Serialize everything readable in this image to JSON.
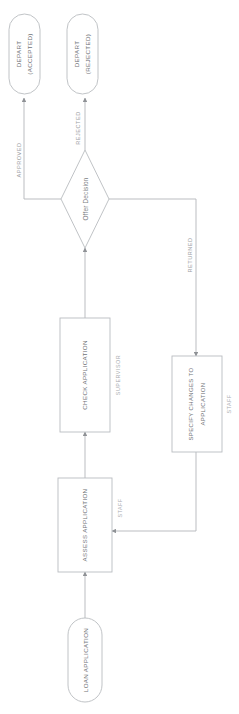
{
  "diagram": {
    "orientation": "rotated-90",
    "colors": {
      "stroke": "#b9bcc0",
      "edge": "#b3b6ba",
      "node_text": "#6f7276",
      "edge_text": "#9a9da1",
      "role_text": "#a9acb0",
      "background": "#ffffff"
    }
  },
  "nodes": {
    "start": {
      "label": "LOAN APPLICATION",
      "type": "terminator"
    },
    "assess": {
      "label": "ASSESS APPLICATION",
      "type": "process",
      "role": "STAFF"
    },
    "check": {
      "label": "CHECK APPLICATION",
      "type": "process",
      "role": "SUPERVISOR"
    },
    "decision": {
      "label": "Offer Decision",
      "type": "decision"
    },
    "specify": {
      "label_line1": "SPECIFY CHANGES TO",
      "label_line2": "APPLICATION",
      "type": "process",
      "role": "STAFF"
    },
    "end_accepted": {
      "label_line1": "DEPART",
      "label_line2": "(ACCEPTED)",
      "type": "terminator"
    },
    "end_rejected": {
      "label_line1": "DEPART",
      "label_line2": "(REJECTED)",
      "type": "terminator"
    }
  },
  "edges": {
    "approved": {
      "label": "APPROVED",
      "from": "decision",
      "to": "end_accepted"
    },
    "rejected": {
      "label": "REJECTED",
      "from": "decision",
      "to": "end_rejected"
    },
    "returned": {
      "label": "RETURNED",
      "from": "decision",
      "to": "specify"
    },
    "start_to_assess": {
      "label": "",
      "from": "start",
      "to": "assess"
    },
    "assess_to_check": {
      "label": "",
      "from": "assess",
      "to": "check"
    },
    "check_to_decision": {
      "label": "",
      "from": "check",
      "to": "decision"
    },
    "specify_to_assess": {
      "label": "",
      "from": "specify",
      "to": "assess"
    }
  }
}
